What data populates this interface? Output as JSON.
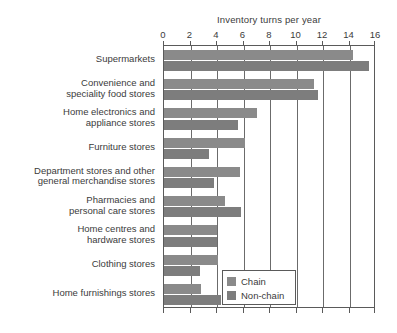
{
  "chart_data": {
    "type": "bar",
    "orientation": "horizontal",
    "title": "Inventory turns per year",
    "xlabel": "",
    "ylabel": "",
    "xlim": [
      0,
      16
    ],
    "xticks": [
      0,
      2,
      4,
      6,
      8,
      10,
      12,
      14,
      16
    ],
    "grid": true,
    "grid_axis": "x",
    "legend_position": "bottom-right",
    "categories": [
      "Supermarkets",
      "Convenience and speciality food stores",
      "Home electronics and appliance stores",
      "Furniture stores",
      "Department stores and other general merchandise stores",
      "Pharmacies and personal care stores",
      "Home centres and hardware stores",
      "Clothing stores",
      "Home furnishings stores"
    ],
    "series": [
      {
        "name": "Chain",
        "color": "#8a8a8a",
        "values": [
          14.3,
          11.3,
          7.0,
          6.1,
          5.7,
          4.6,
          4.0,
          4.1,
          2.8
        ]
      },
      {
        "name": "Non-chain",
        "color": "#7d7d7d",
        "values": [
          15.5,
          11.6,
          5.6,
          3.4,
          3.8,
          5.8,
          4.0,
          2.7,
          4.3
        ]
      }
    ]
  },
  "axis": {
    "tick_labels": [
      "0",
      "2",
      "4",
      "6",
      "8",
      "10",
      "12",
      "14",
      "16"
    ]
  },
  "category_labels": [
    {
      "lines": [
        "Supermarkets"
      ]
    },
    {
      "lines": [
        "Convenience and",
        "speciality food stores"
      ]
    },
    {
      "lines": [
        "Home electronics and",
        "appliance stores"
      ]
    },
    {
      "lines": [
        "Furniture stores"
      ]
    },
    {
      "lines": [
        "Department stores and other",
        "general merchandise stores"
      ]
    },
    {
      "lines": [
        "Pharmacies and",
        "personal care stores"
      ]
    },
    {
      "lines": [
        "Home centres and",
        "hardware stores"
      ]
    },
    {
      "lines": [
        "Clothing stores"
      ]
    },
    {
      "lines": [
        "Home furnishings stores"
      ]
    }
  ],
  "legend": {
    "items": [
      {
        "label": "Chain",
        "color": "#8a8a8a"
      },
      {
        "label": "Non-chain",
        "color": "#7d7d7d"
      }
    ]
  }
}
